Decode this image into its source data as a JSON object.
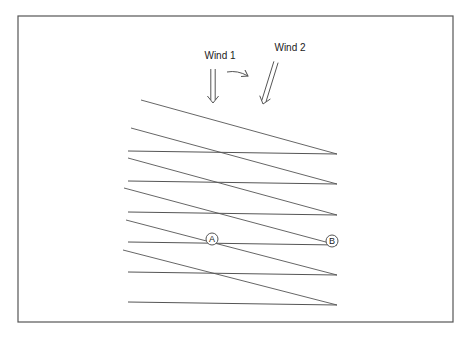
{
  "diagram": {
    "frame": {
      "x": 18,
      "y": 16,
      "width": 435,
      "height": 306,
      "stroke": "#555555"
    },
    "wind1": {
      "label": "Wind 1",
      "label_x": 220,
      "label_y": 59,
      "arrow": {
        "x1": 213,
        "y1": 69,
        "x2": 213,
        "y2": 103
      }
    },
    "wind2": {
      "label": "Wind 2",
      "label_x": 290,
      "label_y": 51,
      "arrow": {
        "x1": 276,
        "y1": 62,
        "x2": 263,
        "y2": 104
      }
    },
    "rotation_arrow": {
      "x1": 227,
      "y1": 72,
      "x2": 248,
      "y2": 76
    },
    "horizontal_lines": [
      {
        "x1": 128,
        "y1": 151,
        "x2": 337,
        "y2": 154
      },
      {
        "x1": 128,
        "y1": 181,
        "x2": 337,
        "y2": 184
      },
      {
        "x1": 128,
        "y1": 212,
        "x2": 337,
        "y2": 215
      },
      {
        "x1": 128,
        "y1": 242,
        "x2": 337,
        "y2": 245
      },
      {
        "x1": 128,
        "y1": 272,
        "x2": 337,
        "y2": 275
      },
      {
        "x1": 128,
        "y1": 302,
        "x2": 337,
        "y2": 305
      }
    ],
    "diagonal_lines": [
      {
        "x1": 141,
        "y1": 100,
        "x2": 337,
        "y2": 154
      },
      {
        "x1": 131,
        "y1": 128,
        "x2": 337,
        "y2": 184
      },
      {
        "x1": 128,
        "y1": 158,
        "x2": 337,
        "y2": 215
      },
      {
        "x1": 124,
        "y1": 188,
        "x2": 337,
        "y2": 245
      },
      {
        "x1": 126,
        "y1": 220,
        "x2": 337,
        "y2": 275
      },
      {
        "x1": 123,
        "y1": 250,
        "x2": 337,
        "y2": 305
      }
    ],
    "points": [
      {
        "label": "A",
        "cx": 212,
        "cy": 239
      },
      {
        "label": "B",
        "cx": 332,
        "cy": 241
      }
    ],
    "line_color": "#555555"
  }
}
